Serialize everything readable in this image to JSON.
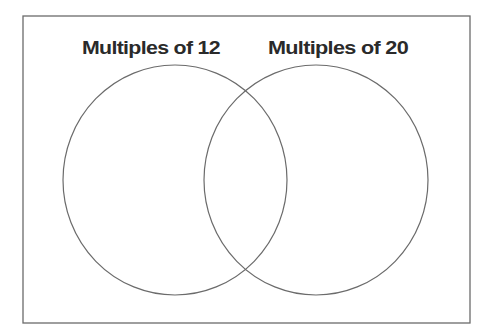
{
  "diagram": {
    "type": "venn",
    "sets": [
      {
        "label": "Multiples of 12"
      },
      {
        "label": "Multiples of 20"
      }
    ],
    "colors": {
      "line": "#6b6b6b",
      "text": "#2a2a2a",
      "background": "#ffffff"
    }
  }
}
